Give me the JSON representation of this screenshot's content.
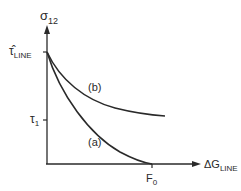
{
  "diagram": {
    "y_axis": {
      "symbol": "σ",
      "subscript": "12"
    },
    "x_axis": {
      "symbol": "ΔG",
      "subscript": "LINE"
    },
    "y_ticks": [
      {
        "symbol": "τ̂",
        "subscript": "LINE"
      },
      {
        "symbol": "τ",
        "subscript": "1"
      }
    ],
    "x_ticks": [
      {
        "symbol": "F",
        "subscript": "0"
      }
    ],
    "curves": [
      {
        "label": "(b)",
        "description": "upper curve, decays asymptotically"
      },
      {
        "label": "(a)",
        "description": "lower curve, reaches zero at F0"
      }
    ],
    "colors": {
      "line": "#2a2a2a",
      "background": "#ffffff"
    }
  }
}
